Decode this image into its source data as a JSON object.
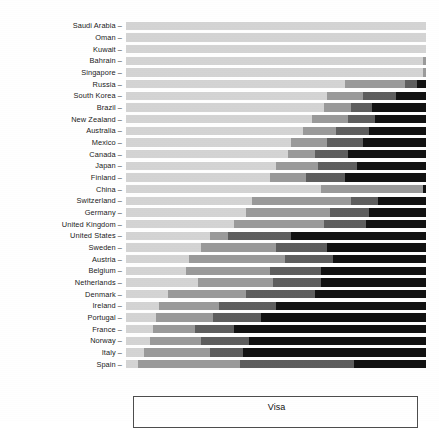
{
  "legend": {
    "title": "Visa"
  },
  "chart_data": {
    "type": "bar",
    "title": "",
    "subtitle": "",
    "xlabel": "",
    "ylabel": "",
    "orientation": "horizontal",
    "stacked": true,
    "normalized": true,
    "grid": false,
    "legend_position": "bottom",
    "legend_title": "Visa",
    "xlim": [
      0,
      100
    ],
    "xticks": [],
    "categories": [
      "Saudi Arabia",
      "Oman",
      "Kuwait",
      "Bahrain",
      "Singapore",
      "Russia",
      "South Korea",
      "Brazil",
      "New Zealand",
      "Australia",
      "Mexico",
      "Canada",
      "Japan",
      "Finland",
      "China",
      "Switzerland",
      "Germany",
      "United Kingdom",
      "United States",
      "Sweden",
      "Austria",
      "Belgium",
      "Netherlands",
      "Denmark",
      "Ireland",
      "Portugal",
      "France",
      "Norway",
      "Italy",
      "Spain"
    ],
    "series": [
      {
        "name": "segment-1",
        "color": "#d4d4d4",
        "values": [
          100,
          100,
          100,
          99,
          99,
          73,
          67,
          66,
          62,
          59,
          55,
          54,
          50,
          48,
          65,
          42,
          40,
          36,
          28,
          25,
          21,
          20,
          24,
          14,
          11,
          10,
          9,
          8,
          6,
          4
        ]
      },
      {
        "name": "segment-2",
        "color": "#9a9a9a",
        "values": [
          0,
          0,
          0,
          1,
          1,
          20,
          12,
          9,
          12,
          11,
          12,
          9,
          14,
          12,
          34,
          33,
          28,
          30,
          6,
          25,
          32,
          28,
          25,
          26,
          20,
          19,
          14,
          17,
          22,
          34
        ]
      },
      {
        "name": "segment-3",
        "color": "#5e5e5e",
        "values": [
          0,
          0,
          0,
          0,
          0,
          4,
          11,
          7,
          9,
          11,
          12,
          11,
          13,
          13,
          0,
          9,
          13,
          14,
          21,
          17,
          16,
          17,
          16,
          23,
          19,
          16,
          13,
          16,
          11,
          38
        ]
      },
      {
        "name": "segment-4",
        "color": "#121212",
        "values": [
          0,
          0,
          0,
          0,
          0,
          3,
          10,
          18,
          17,
          19,
          21,
          26,
          23,
          27,
          1,
          16,
          19,
          20,
          45,
          33,
          31,
          35,
          35,
          37,
          50,
          55,
          64,
          59,
          61,
          24
        ]
      }
    ]
  }
}
